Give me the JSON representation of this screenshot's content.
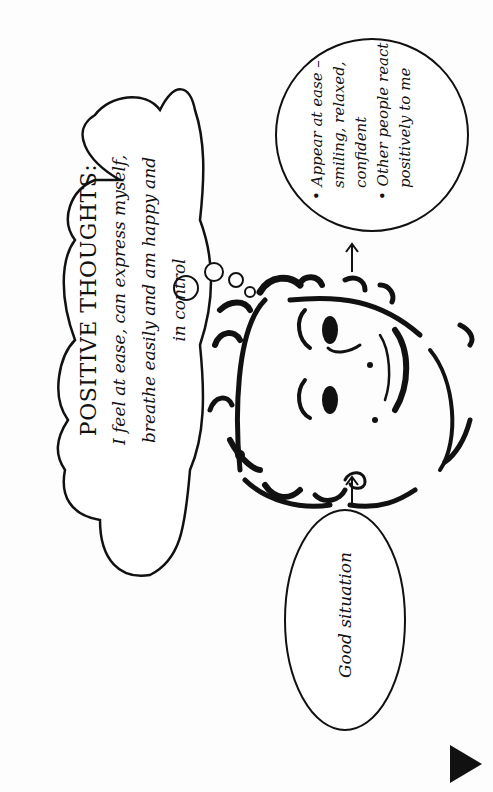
{
  "thought_cloud": {
    "title": "POSITIVE THOUGHTS:",
    "lines": [
      "I feel at ease, can express myself,",
      "breathe easily and am happy and",
      "in control"
    ]
  },
  "situation": {
    "label": "Good situation"
  },
  "outcomes": {
    "items": [
      {
        "lines": [
          "Appear at ease –",
          "smiling, relaxed,",
          "confident"
        ]
      },
      {
        "lines": [
          "Other people react",
          "positively to me"
        ]
      }
    ]
  },
  "icons": {
    "arrow_situation_to_face": "arrow-up-icon",
    "arrow_face_to_outcomes": "arrow-up-icon",
    "next_page": "play-triangle-icon"
  },
  "colors": {
    "ink": "#111111",
    "paper": "#fdfdfd"
  }
}
